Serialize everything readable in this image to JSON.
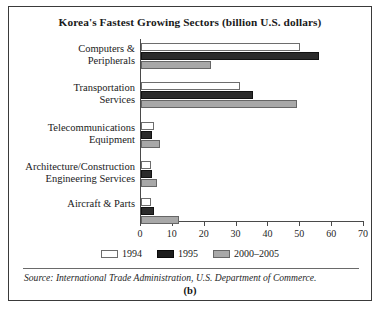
{
  "figure": {
    "title": "Korea's Fastest Growing Sectors (billion U.S. dollars)",
    "panel_label": "(b)",
    "source_note": "Source: International Trade Administration, U.S. Department of Commerce."
  },
  "colors": {
    "series_1994": "#ffffff",
    "series_1995": "#1c1c1c",
    "series_2000_2005": "#a8a8a8",
    "axis": "#4a4a4a",
    "frame": "#3a3a3a",
    "text": "#1a1a1a"
  },
  "chart_data": {
    "type": "bar",
    "orientation": "horizontal",
    "title": "Korea's Fastest Growing Sectors (billion U.S. dollars)",
    "xlabel": "",
    "ylabel": "",
    "xlim": [
      0,
      70
    ],
    "xticks": [
      0,
      10,
      20,
      30,
      40,
      50,
      60,
      70
    ],
    "grid": false,
    "legend_position": "bottom",
    "categories": [
      "Computers &\nPeripherals",
      "Transportation\nServices",
      "Telecommunications\nEquipment",
      "Architecture/Construction\nEngineering Services",
      "Aircraft & Parts"
    ],
    "series": [
      {
        "name": "1994",
        "values": [
          50,
          31,
          4,
          3,
          3
        ]
      },
      {
        "name": "1995",
        "values": [
          56,
          35,
          3.5,
          3.5,
          4
        ]
      },
      {
        "name": "2000–2005",
        "values": [
          22,
          49,
          6,
          5,
          12
        ]
      }
    ]
  },
  "legend": {
    "entries": [
      {
        "label": "1994"
      },
      {
        "label": "1995"
      },
      {
        "label": "2000–2005"
      }
    ]
  },
  "axis": {
    "tick_labels": [
      "0",
      "10",
      "20",
      "30",
      "40",
      "50",
      "60",
      "70"
    ]
  }
}
